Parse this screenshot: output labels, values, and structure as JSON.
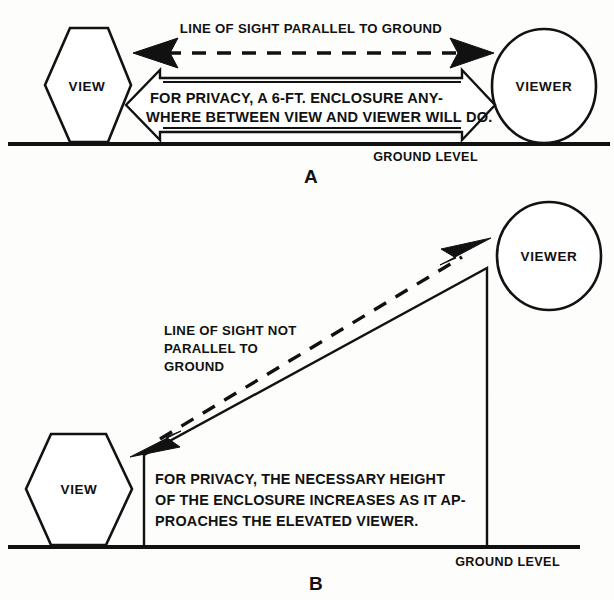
{
  "figure": {
    "background_color": "#fdfdfc",
    "ink_color": "#111111"
  },
  "panel_a": {
    "label": "A",
    "sight_label": "LINE OF SIGHT PARALLEL TO GROUND",
    "view_label": "VIEW",
    "viewer_label": "VIEWER",
    "ground_label": "GROUND LEVEL",
    "banner_lines": [
      "FOR  PRIVACY,  A  6-FT.  ENCLOSURE  ANY-",
      "WHERE BETWEEN VIEW AND VIEWER WILL DO."
    ]
  },
  "panel_b": {
    "label": "B",
    "sight_label_lines": [
      "LINE OF SIGHT NOT",
      "PARALLEL TO",
      "GROUND"
    ],
    "view_label": "VIEW",
    "viewer_label": "VIEWER",
    "ground_label": "GROUND LEVEL",
    "note_lines": [
      "FOR  PRIVACY,  THE  NECESSARY  HEIGHT",
      "OF  THE  ENCLOSURE  INCREASES  AS  IT  AP-",
      "PROACHES THE ELEVATED VIEWER."
    ]
  }
}
